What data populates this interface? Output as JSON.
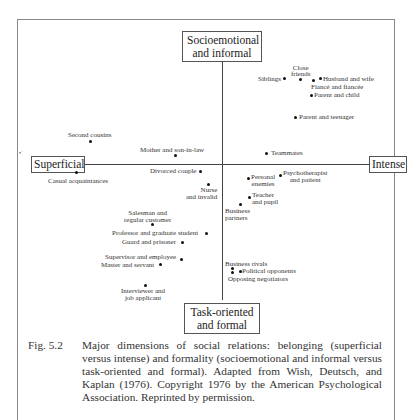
{
  "figure": {
    "axes": {
      "top": "Socioemotional and informal",
      "top_lines": [
        "Socioemotional",
        "and informal"
      ],
      "bottom_lines": [
        "Task-oriented",
        "and formal"
      ],
      "left": "Superficial",
      "right": "Intense"
    },
    "points": [
      {
        "label": "Siblings",
        "quadrant": "upper-right"
      },
      {
        "label": "Close friends",
        "quadrant": "upper-right"
      },
      {
        "label": "Husband and wife",
        "quadrant": "upper-right"
      },
      {
        "label": "Fiancé and fiancée",
        "quadrant": "upper-right"
      },
      {
        "label": "Parent and child",
        "quadrant": "upper-right"
      },
      {
        "label": "Parent and teenager",
        "quadrant": "upper-right"
      },
      {
        "label": "Teammates",
        "quadrant": "upper-right"
      },
      {
        "label": "Second cousins",
        "quadrant": "upper-left"
      },
      {
        "label": "Mother and son-in-law",
        "quadrant": "upper-left"
      },
      {
        "label": "Casual acquaintances",
        "quadrant": "lower-left"
      },
      {
        "label": "Divorced couple",
        "quadrant": "lower-left"
      },
      {
        "label": "Nurse and invalid",
        "quadrant": "lower-left"
      },
      {
        "label": "Personal enemies",
        "quadrant": "lower-right"
      },
      {
        "label": "Psychotherapist and patient",
        "quadrant": "lower-right"
      },
      {
        "label": "Teacher and pupil",
        "quadrant": "lower-right"
      },
      {
        "label": "Business partners",
        "quadrant": "lower-right"
      },
      {
        "label": "Salesman and regular customer",
        "quadrant": "lower-left"
      },
      {
        "label": "Professor and graduate student",
        "quadrant": "lower-left"
      },
      {
        "label": "Guard and prisoner",
        "quadrant": "lower-left"
      },
      {
        "label": "Supervisor and employee",
        "quadrant": "lower-left"
      },
      {
        "label": "Master and servant",
        "quadrant": "lower-left"
      },
      {
        "label": "Interviewer and job applicant",
        "quadrant": "lower-left"
      },
      {
        "label": "Business rivals",
        "quadrant": "lower-right"
      },
      {
        "label": "Political opponents",
        "quadrant": "lower-right"
      },
      {
        "label": "Opposing negotiators",
        "quadrant": "lower-right"
      }
    ],
    "labels": {
      "siblings": "Siblings",
      "close_friends_1": "Close",
      "close_friends_2": "friends",
      "husband_wife": "Husband and wife",
      "fiance": "Fiancé and fiancée",
      "parent_child": "Parent and child",
      "parent_teen": "Parent and teenager",
      "teammates": "Teammates",
      "second_cousins": "Second cousins",
      "mother_soninlaw": "Mother and son-in-law",
      "casual": "Casual acquaintances",
      "divorced": "Divorced couple",
      "nurse_1": "Nurse",
      "nurse_2": "and invalid",
      "enemies_1": "Personal",
      "enemies_2": "enemies",
      "psych_1": "Psychotherapist",
      "psych_2": "and patient",
      "teacher_1": "Teacher",
      "teacher_2": "and pupil",
      "partners_1": "Business",
      "partners_2": "partners",
      "salesman_1": "Salesman and",
      "salesman_2": "regular customer",
      "professor": "Professor and graduate student",
      "guard": "Guard and prisoner",
      "supervisor": "Supervisor and employee",
      "master": "Master and servant",
      "interviewer_1": "Interviewer and",
      "interviewer_2": "job applicant",
      "rivals": "Business rivals",
      "political": "Political opponents",
      "negotiators": "Opposing negotiators"
    }
  },
  "caption": {
    "number": "Fig. 5.2",
    "text": "Major dimensions of social relations: belonging (superficial versus intense) and formality (socioemotional and informal versus task-oriented and formal). Adapted from Wish, Deutsch, and Kaplan (1976). Copyright 1976 by the American Psychological Association. Reprinted by permission."
  }
}
